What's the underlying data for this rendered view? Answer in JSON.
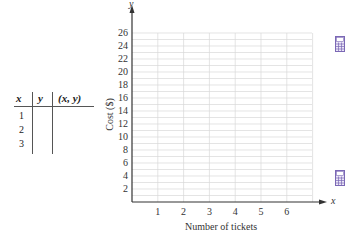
{
  "table": {
    "headers": [
      "x",
      "y",
      "(x, y)"
    ],
    "rows": [
      {
        "x": "1",
        "y": "",
        "xy": ""
      },
      {
        "x": "2",
        "y": "",
        "xy": ""
      },
      {
        "x": "3",
        "y": "",
        "xy": ""
      }
    ]
  },
  "chart_data": {
    "type": "line",
    "title": "",
    "xlabel": "Number of tickets",
    "ylabel": "Cost ($)",
    "x_axis_letter": "x",
    "y_axis_letter": "y",
    "x_ticks": [
      "1",
      "2",
      "3",
      "4",
      "5",
      "6"
    ],
    "y_ticks": [
      "2",
      "4",
      "6",
      "8",
      "10",
      "12",
      "14",
      "16",
      "18",
      "20",
      "22",
      "24",
      "26"
    ],
    "xlim": [
      0,
      7
    ],
    "ylim": [
      0,
      26
    ],
    "grid": true,
    "series": []
  },
  "colors": {
    "grid": "#d9d9d9",
    "axis": "#333333",
    "icon": "#7b68b5"
  },
  "icons": [
    "calculator-icon",
    "calculator-icon"
  ]
}
